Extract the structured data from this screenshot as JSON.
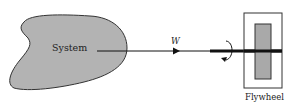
{
  "diagram": {
    "system": {
      "label": "System",
      "fill": "#b3b3b3",
      "stroke": "#333333"
    },
    "work": {
      "label": "W"
    },
    "flywheel": {
      "label": "Flywheel",
      "inner_fill": "#a9a9a9"
    },
    "colors": {
      "line": "#111111",
      "text": "#222222"
    }
  }
}
